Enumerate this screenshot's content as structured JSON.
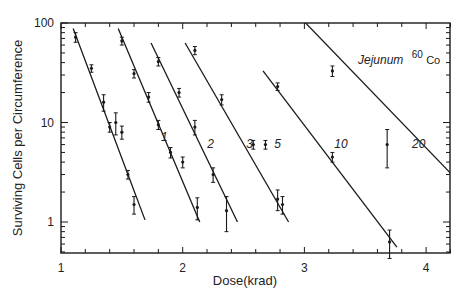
{
  "chart_data": {
    "type": "scatter",
    "title": "",
    "annotation": {
      "text": "Jejunum",
      "superscript": "60",
      "suffix": "Co"
    },
    "xlabel": "Dose(krad)",
    "ylabel": "Surviving Cells per Circumference",
    "xlim": [
      1,
      4.2
    ],
    "ylim": [
      0.5,
      100
    ],
    "yscale": "log",
    "x_ticks": [
      "1",
      "2",
      "3",
      "4"
    ],
    "y_ticks": [
      "1",
      "10",
      "100"
    ],
    "grid": false,
    "legend": "none (lines labeled inline by number of fractions)",
    "series": [
      {
        "name": "1",
        "label_pos": [
          1.85,
          6.5
        ],
        "line": [
          [
            1.1,
            88
          ],
          [
            1.69,
            1.05
          ]
        ],
        "points": [
          [
            1.12,
            72,
            8
          ],
          [
            1.25,
            35,
            3
          ],
          [
            1.35,
            16,
            3
          ],
          [
            1.4,
            9,
            1
          ],
          [
            1.45,
            10,
            2.5
          ],
          [
            1.5,
            8,
            1.2
          ],
          [
            1.55,
            3,
            0.3
          ],
          [
            1.6,
            1.5,
            0.3
          ]
        ]
      },
      {
        "name": "2",
        "label_pos": [
          2.23,
          5.5
        ],
        "line": [
          [
            1.47,
            88
          ],
          [
            2.14,
            1.0
          ]
        ],
        "points": [
          [
            1.5,
            66,
            6
          ],
          [
            1.6,
            31,
            3
          ],
          [
            1.72,
            18,
            2
          ],
          [
            1.8,
            9.5,
            1
          ],
          [
            1.9,
            5,
            0.6
          ],
          [
            2.0,
            4,
            0.5
          ],
          [
            2.12,
            1.4,
            0.35
          ]
        ]
      },
      {
        "name": "3",
        "label_pos": [
          2.55,
          5.5
        ],
        "line": [
          [
            1.74,
            63
          ],
          [
            2.45,
            1.0
          ]
        ],
        "points": [
          [
            1.8,
            41,
            4
          ],
          [
            1.97,
            20,
            2
          ],
          [
            2.1,
            9,
            1.5
          ],
          [
            2.25,
            3,
            0.5
          ],
          [
            2.36,
            1.3,
            0.5
          ]
        ]
      },
      {
        "name": "5",
        "label_pos": [
          2.78,
          5.5
        ],
        "line": [
          [
            2.02,
            63
          ],
          [
            2.87,
            1.0
          ]
        ],
        "points": [
          [
            2.1,
            53,
            5
          ],
          [
            2.32,
            17,
            2
          ],
          [
            2.58,
            6,
            0.6
          ],
          [
            2.68,
            6,
            0.6
          ],
          [
            2.78,
            1.7,
            0.4
          ],
          [
            2.82,
            1.5,
            0.3
          ]
        ]
      },
      {
        "name": "10",
        "label_pos": [
          3.3,
          5.5
        ],
        "line": [
          [
            2.66,
            33
          ],
          [
            3.76,
            0.56
          ]
        ],
        "points": [
          [
            2.78,
            23,
            2
          ],
          [
            3.23,
            4.5,
            0.5
          ],
          [
            3.7,
            0.63,
            0.2
          ]
        ]
      },
      {
        "name": "20",
        "label_pos": [
          3.94,
          5.5
        ],
        "line": [
          [
            3.0,
            103
          ],
          [
            4.2,
            3.1
          ]
        ],
        "points": [
          [
            3.23,
            33,
            4
          ],
          [
            3.68,
            6,
            2.5
          ]
        ]
      }
    ]
  }
}
